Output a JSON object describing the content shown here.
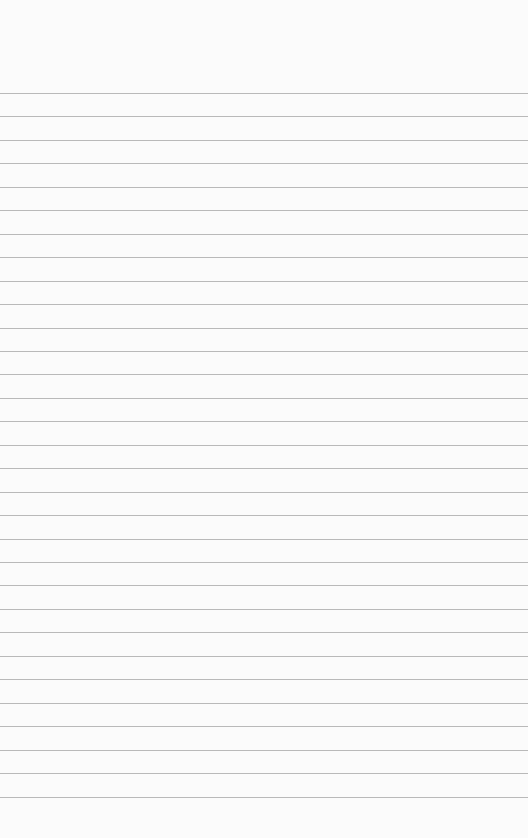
{
  "paper": {
    "type": "lined-notepad",
    "background_color": "#fbfbfb",
    "line_color": "#b9b9b9",
    "first_line_y": 93,
    "line_spacing": 23.45,
    "line_count": 31,
    "text": ""
  }
}
